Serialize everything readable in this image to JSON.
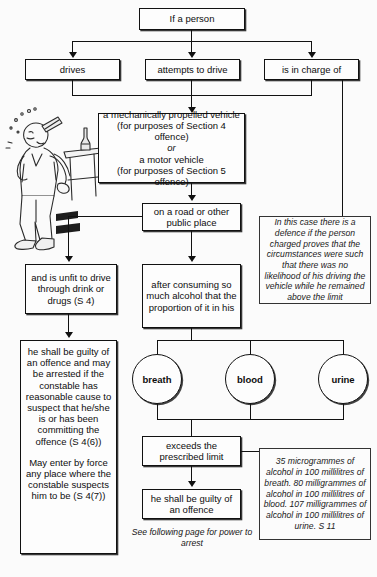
{
  "diagram": {
    "nodes": {
      "if_person": "If a person",
      "drives": "drives",
      "attempts": "attempts to drive",
      "in_charge": "is in charge of",
      "vehicle_l1": "a mechanically propelled vehicle",
      "vehicle_l2": "(for purposes of Section 4 offence)",
      "vehicle_or": "or",
      "vehicle_l3": "a motor vehicle",
      "vehicle_l4": "(for purposes of Section 5 offence)",
      "road": "on a road or other public place",
      "unfit": "and is unfit to drive through drink or drugs (S 4)",
      "after_consuming": "after consuming so much alcohol that the proportion of it in his",
      "guilty_arrest": "he shall be guilty of an offence and may be arrested if the constable has reasonable cause to suspect that he/she is or has been committing the offence (S 4(6))",
      "may_enter": "May enter by force any place where the constable suspects him to be (S 4(7))",
      "breath": "breath",
      "blood": "blood",
      "urine": "urine",
      "exceeds": "exceeds the prescribed limit",
      "guilty": "he shall be guilty of an offence"
    },
    "notes": {
      "defence": "In this case there is a defence if the person charged proves that the circumstances were such that there was no likelihood of his driving the vehicle while he remained above the limit",
      "limits": "35 microgrammes of alcohol in 100 millilitres of breath. 80 milligrammes of alcohol in 100 millilitres of blood. 107 milligrammes of alcohol in 100 millilitres of urine. S 11",
      "see_following": "See following page for power to arrest"
    },
    "illustration": "man-drinking-at-bar-cartoon"
  }
}
